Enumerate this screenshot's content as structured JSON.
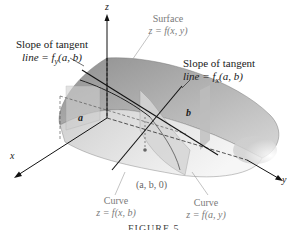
{
  "figure": {
    "caption": "FIGURE 5",
    "axes": {
      "x": "x",
      "y": "y",
      "z": "z"
    },
    "points": {
      "a": "a",
      "b": "b",
      "origin_point": "(a, b, 0)"
    },
    "labels": {
      "surface_title": "Surface",
      "surface_eq": "z = f(x, y)",
      "tangent_fy_line1": "Slope of tangent",
      "tangent_fy_line2": "line = f",
      "tangent_fy_sub": "y",
      "tangent_fy_args": "(a, b)",
      "tangent_fx_line1": "Slope of tangent",
      "tangent_fx_line2": "line = f",
      "tangent_fx_sub": "x",
      "tangent_fx_args": "(a, b)",
      "curve1_title": "Curve",
      "curve1_eq": "z = f(x, b)",
      "curve2_title": "Curve",
      "curve2_eq": "z = f(a, y)"
    },
    "colors": {
      "surface_light": "#e6e6e6",
      "surface_mid": "#c8c8c8",
      "surface_dark": "#9a9a9a",
      "line": "#111111",
      "leader": "#9a9a9a"
    }
  }
}
